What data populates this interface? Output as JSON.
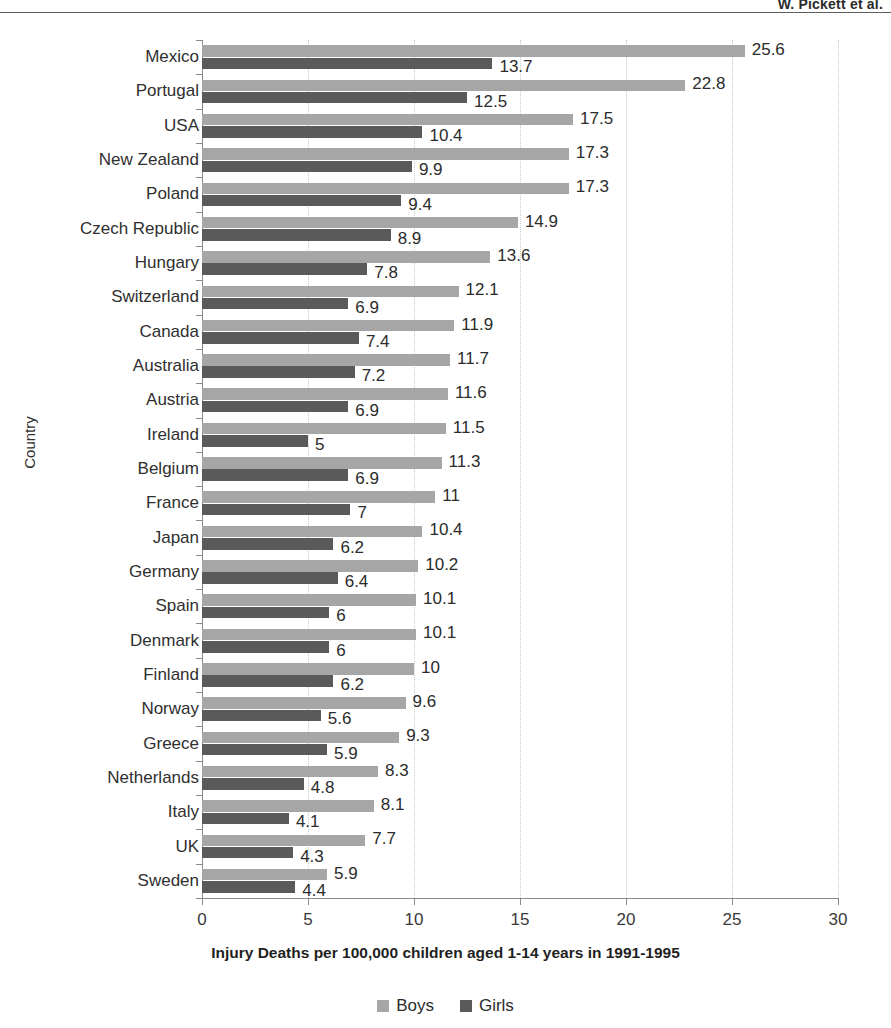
{
  "running_head": "W. Pickett et al.",
  "chart_data": {
    "type": "bar",
    "orientation": "horizontal",
    "title": "",
    "xlabel": "Injury Deaths per 100,000 children aged 1-14 years in 1991-1995",
    "ylabel": "Country",
    "xlim": [
      0,
      30
    ],
    "xticks": [
      0,
      5,
      10,
      15,
      20,
      25,
      30
    ],
    "grid": true,
    "legend_position": "bottom",
    "categories": [
      "Mexico",
      "Portugal",
      "USA",
      "New Zealand",
      "Poland",
      "Czech Republic",
      "Hungary",
      "Switzerland",
      "Canada",
      "Australia",
      "Austria",
      "Ireland",
      "Belgium",
      "France",
      "Japan",
      "Germany",
      "Spain",
      "Denmark",
      "Finland",
      "Norway",
      "Greece",
      "Netherlands",
      "Italy",
      "UK",
      "Sweden"
    ],
    "series": [
      {
        "name": "Boys",
        "color": "#a6a6a6",
        "values": [
          25.6,
          22.8,
          17.5,
          17.3,
          17.3,
          14.9,
          13.6,
          12.1,
          11.9,
          11.7,
          11.6,
          11.5,
          11.3,
          11,
          10.4,
          10.2,
          10.1,
          10.1,
          10,
          9.6,
          9.3,
          8.3,
          8.1,
          7.7,
          5.9
        ],
        "labels": [
          "25.6",
          "22.8",
          "17.5",
          "17.3",
          "17.3",
          "14.9",
          "13.6",
          "12.1",
          "11.9",
          "11.7",
          "11.6",
          "11.5",
          "11.3",
          "11",
          "10.4",
          "10.2",
          "10.1",
          "10.1",
          "10",
          "9.6",
          "9.3",
          "8.3",
          "8.1",
          "7.7",
          "5.9"
        ]
      },
      {
        "name": "Girls",
        "color": "#5a5a5a",
        "values": [
          13.7,
          12.5,
          10.4,
          9.9,
          9.4,
          8.9,
          7.8,
          6.9,
          7.4,
          7.2,
          6.9,
          5,
          6.9,
          7,
          6.2,
          6.4,
          6,
          6,
          6.2,
          5.6,
          5.9,
          4.8,
          4.1,
          4.3,
          4.4
        ],
        "labels": [
          "13.7",
          "12.5",
          "10.4",
          "9.9",
          "9.4",
          "8.9",
          "7.8",
          "6.9",
          "7.4",
          "7.2",
          "6.9",
          "5",
          "6.9",
          "7",
          "6.2",
          "6.4",
          "6",
          "6",
          "6.2",
          "5.6",
          "5.9",
          "4.8",
          "4.1",
          "4.3",
          "4.4"
        ]
      }
    ]
  },
  "legend": [
    {
      "label": "Boys",
      "color": "#a6a6a6"
    },
    {
      "label": "Girls",
      "color": "#5a5a5a"
    }
  ]
}
